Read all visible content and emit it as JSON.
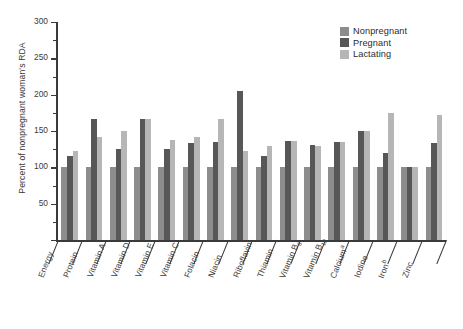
{
  "chart_data": {
    "type": "bar",
    "title": "",
    "subtitle": "",
    "xlabel": "",
    "ylabel": "Percent of nonpregnant woman's RDA",
    "ylim": [
      0,
      300
    ],
    "yticks": [
      0,
      50,
      100,
      150,
      200,
      250,
      300
    ],
    "ytick_labels": [
      "",
      "50",
      "100",
      "150",
      "200",
      "250",
      "300"
    ],
    "yminor_step": 25,
    "grid": false,
    "legend_position": "top-right",
    "categories": [
      "Energy",
      "Protein",
      "Vitamin A",
      "Vitamin D",
      "Vitamin E",
      "Vitamin C",
      "Folacin",
      "Niacin",
      "Riboflavin",
      "Thiamin",
      "Vitamin B6",
      "Vitamin B12",
      "Calcium",
      "Iodine",
      "Iron",
      "Zinc"
    ],
    "category_labels_html": [
      "Energy",
      "Protein",
      "Vitamin A",
      "Vitamin D",
      "Vitamin E",
      "Vitamin C",
      "Folacin",
      "Niacin",
      "Riboflavin",
      "Thiamin",
      "Vitamin B<sub>6</sub>",
      "Vitamin B<sub>12</sub>",
      "Calcium<sup>a</sup>",
      "Iodine",
      "Iron<sup>b</sup>",
      "Zinc"
    ],
    "series": [
      {
        "name": "Nonpregnant",
        "color": "#8d8d8d",
        "values": [
          100,
          100,
          100,
          100,
          100,
          100,
          100,
          100,
          100,
          100,
          100,
          100,
          100,
          100,
          100,
          100
        ]
      },
      {
        "name": "Pregnant",
        "color": "#575757",
        "values": [
          115,
          167,
          125,
          167,
          125,
          133,
          135,
          205,
          115,
          136,
          131,
          135,
          150,
          120,
          100,
          133
        ]
      },
      {
        "name": "Lactating",
        "color": "#b6b6b6",
        "values": [
          123,
          142,
          150,
          167,
          138,
          142,
          167,
          123,
          130,
          136,
          129,
          135,
          150,
          175,
          100,
          172
        ]
      }
    ]
  },
  "legend": {
    "items": [
      {
        "label": "Nonpregnant",
        "color": "#8d8d8d"
      },
      {
        "label": "Pregnant",
        "color": "#575757"
      },
      {
        "label": "Lactating",
        "color": "#b6b6b6"
      }
    ]
  }
}
